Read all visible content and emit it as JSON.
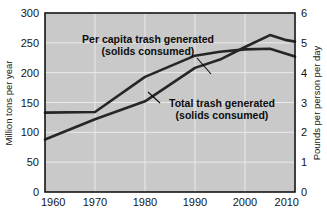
{
  "chart_data": {
    "type": "line",
    "title": "",
    "subtitle": "",
    "plot_background": "#c9c9c9",
    "gridline_color": "#e8e8e8",
    "line_color": "#262626",
    "axis_color": "#141414",
    "grid": true,
    "legend_position": "annotations-inline",
    "x": [
      1960,
      1970,
      1980,
      1990,
      2000,
      2010
    ],
    "xlabel": "",
    "xtick_labels": [
      "1960",
      "1970",
      "1980",
      "1990",
      "2000",
      "2010"
    ],
    "xlim": [
      1960,
      2010
    ],
    "left_axis": {
      "ylabel": "Million tons per year",
      "ylim": [
        0,
        300
      ],
      "ytick_labels": [
        "0",
        "50",
        "100",
        "150",
        "200",
        "250",
        "300"
      ],
      "yticks": [
        0,
        50,
        100,
        150,
        200,
        250,
        300
      ]
    },
    "right_axis": {
      "ylabel": "Pounds per person per day",
      "ylim": [
        0,
        6
      ],
      "ytick_labels": [
        "0",
        "1",
        "2",
        "3",
        "4",
        "5",
        "6"
      ],
      "yticks": [
        0,
        1,
        2,
        3,
        4,
        5,
        6
      ]
    },
    "series": [
      {
        "name": "Total trash generated (solids consumed)",
        "axis": "left",
        "units": "million tons per year",
        "points": [
          {
            "x": 1960,
            "y": 88
          },
          {
            "x": 1970,
            "y": 122
          },
          {
            "x": 1980,
            "y": 152
          },
          {
            "x": 1990,
            "y": 208
          },
          {
            "x": 1995,
            "y": 222
          },
          {
            "x": 2000,
            "y": 243
          },
          {
            "x": 2005,
            "y": 263
          },
          {
            "x": 2008,
            "y": 255
          },
          {
            "x": 2010,
            "y": 252
          }
        ]
      },
      {
        "name": "Per capita trash generated (solids consumed)",
        "axis": "right",
        "units": "pounds per person per day",
        "points": [
          {
            "x": 1960,
            "y": 2.66
          },
          {
            "x": 1970,
            "y": 2.68
          },
          {
            "x": 1980,
            "y": 3.86
          },
          {
            "x": 1990,
            "y": 4.57
          },
          {
            "x": 1995,
            "y": 4.7
          },
          {
            "x": 2000,
            "y": 4.78
          },
          {
            "x": 2005,
            "y": 4.8
          },
          {
            "x": 2010,
            "y": 4.54
          }
        ]
      }
    ],
    "annotations": [
      {
        "id": "per-capita",
        "line1": "Per capita trash generated",
        "line2": "(solids consumed)",
        "leader_from": {
          "x": 1990,
          "y_px": 73
        },
        "leader_to": {
          "x": 1990,
          "y_px": 58
        }
      },
      {
        "id": "total-trash",
        "line1": "Total trash generated",
        "line2": "(solids consumed)",
        "leader_from": {
          "x": 1980,
          "y_px": 95
        },
        "leader_to": {
          "x": 1980,
          "y_px": 105
        }
      }
    ]
  }
}
